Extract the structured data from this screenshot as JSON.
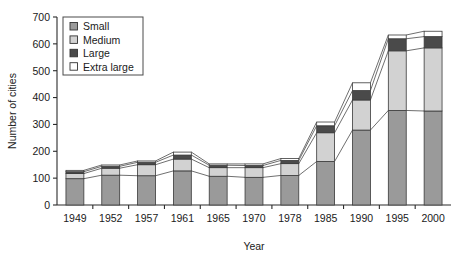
{
  "chart_data": {
    "type": "bar",
    "stacked": true,
    "title": "",
    "xlabel": "Year",
    "ylabel": "Number of cities",
    "categories": [
      "1949",
      "1952",
      "1957",
      "1961",
      "1965",
      "1970",
      "1978",
      "1985",
      "1990",
      "1995",
      "2000"
    ],
    "ylim": [
      0,
      700
    ],
    "yticks": [
      0,
      100,
      200,
      300,
      400,
      500,
      600,
      700
    ],
    "grid": false,
    "legend_position": "top-left",
    "series": [
      {
        "name": "Small",
        "color": "#9a9a9a",
        "values": [
          98,
          111,
          109,
          127,
          107,
          103,
          110,
          162,
          279,
          352,
          350
        ]
      },
      {
        "name": "Medium",
        "color": "#d2d2d2",
        "values": [
          19,
          26,
          41,
          44,
          32,
          36,
          44,
          107,
          112,
          222,
          235
        ]
      },
      {
        "name": "Large",
        "color": "#4a4a4a",
        "values": [
          7,
          7,
          9,
          15,
          9,
          8,
          12,
          26,
          35,
          45,
          42
        ]
      },
      {
        "name": "Extra large",
        "color": "#ffffff",
        "values": [
          5,
          5,
          5,
          11,
          5,
          6,
          7,
          14,
          29,
          14,
          20
        ]
      }
    ],
    "totals": [
      129,
      149,
      164,
      197,
      153,
      153,
      173,
      309,
      455,
      633,
      647
    ]
  },
  "legend": {
    "items": [
      {
        "label": "Small"
      },
      {
        "label": "Medium"
      },
      {
        "label": "Large"
      },
      {
        "label": "Extra large"
      }
    ]
  },
  "axes": {
    "ylabel": "Number of cities",
    "xlabel": "Year",
    "ytick_labels": [
      "0",
      "100",
      "200",
      "300",
      "400",
      "500",
      "600",
      "700"
    ],
    "xtick_labels": [
      "1949",
      "1952",
      "1957",
      "1961",
      "1965",
      "1970",
      "1978",
      "1985",
      "1990",
      "1995",
      "2000"
    ]
  }
}
